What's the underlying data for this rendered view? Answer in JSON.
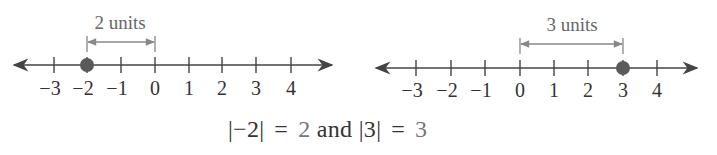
{
  "figure": {
    "left_number_line": {
      "ticks": [
        "−3",
        "−2",
        "−1",
        "0",
        "1",
        "2",
        "3",
        "4"
      ],
      "point_label": "−2",
      "distance_label": "2 units"
    },
    "right_number_line": {
      "ticks": [
        "−3",
        "−2",
        "−1",
        "0",
        "1",
        "2",
        "3",
        "4"
      ],
      "point_label": "3",
      "distance_label": "3 units"
    },
    "equation": {
      "abs_a_open": "|",
      "a": "−2",
      "abs_a_close": "|",
      "eq1": "=",
      "a_value": "2",
      "conj": "and",
      "abs_b_open": "|",
      "b": "3",
      "abs_b_close": "|",
      "eq2": "=",
      "b_value": "3"
    },
    "colors": {
      "line": "#444444",
      "point": "#555555",
      "bracket": "#777777"
    }
  }
}
